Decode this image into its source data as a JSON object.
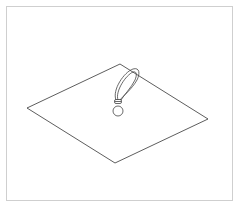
{
  "figure": {
    "colors": {
      "stroke": "#333333",
      "frame": "#cfcfcf",
      "background": "#ffffff"
    },
    "sheet": {
      "points": [
        [
          27,
          108
        ],
        [
          120,
          64
        ],
        [
          208,
          119
        ],
        [
          115,
          163
        ]
      ]
    },
    "loop": {
      "top": [
        136,
        70
      ],
      "knot": [
        118,
        101
      ]
    },
    "ball": {
      "cx": 118,
      "cy": 112,
      "r": 5
    }
  }
}
